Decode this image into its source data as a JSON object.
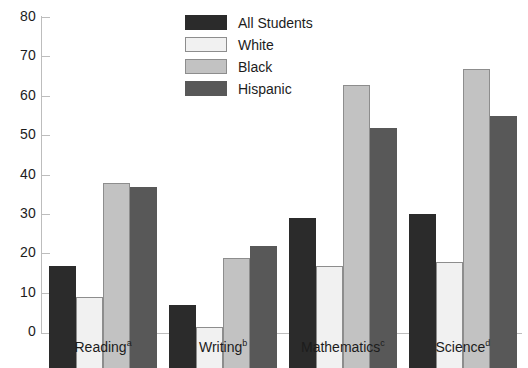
{
  "chart_data": {
    "type": "bar",
    "title": "",
    "subtitle": "",
    "xlabel": "",
    "ylabel": "",
    "ylim": [
      0,
      80
    ],
    "ytick_values": [
      0,
      10,
      20,
      30,
      40,
      50,
      60,
      70,
      80
    ],
    "ytick_labels": [
      "0",
      "10",
      "20",
      "30",
      "40",
      "50",
      "60",
      "70",
      "80"
    ],
    "grid": false,
    "legend_position": "top-center",
    "categories": [
      "Reading",
      "Writing",
      "Mathematics",
      "Science"
    ],
    "category_label_parts": [
      {
        "text": "Reading",
        "superscript": "a"
      },
      {
        "text": "Writing",
        "superscript": "b"
      },
      {
        "text": "Mathematics",
        "superscript": "c"
      },
      {
        "text": "Science",
        "superscript": "d"
      }
    ],
    "series": [
      {
        "name": "All Students",
        "color": "#2b2b2b",
        "values": [
          26,
          16,
          38,
          39
        ]
      },
      {
        "name": "White",
        "color": "#f1f1f1",
        "values": [
          18,
          10.5,
          26,
          27
        ]
      },
      {
        "name": "Black",
        "color": "#c2c2c2",
        "values": [
          47,
          28,
          72,
          76
        ]
      },
      {
        "name": "Hispanic",
        "color": "#585858",
        "values": [
          46,
          31,
          61,
          64
        ]
      }
    ],
    "annotations": []
  },
  "legend": {
    "items": [
      {
        "label": "All Students"
      },
      {
        "label": "White"
      },
      {
        "label": "Black"
      },
      {
        "label": "Hispanic"
      }
    ]
  },
  "colors": {
    "all_students": "#2b2b2b",
    "white": "#f1f1f1",
    "black": "#c2c2c2",
    "hispanic": "#585858",
    "axis": "#bdbdbd",
    "text": "#1c1c1c",
    "background": "#ffffff"
  }
}
